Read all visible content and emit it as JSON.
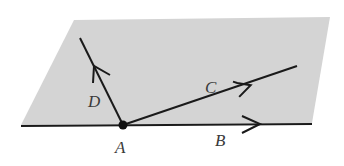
{
  "diagram": {
    "plane_color": "#d4d4d4",
    "line_color": "#1a1a1a",
    "labels": {
      "A": "A",
      "B": "B",
      "C": "C",
      "D": "D"
    }
  }
}
